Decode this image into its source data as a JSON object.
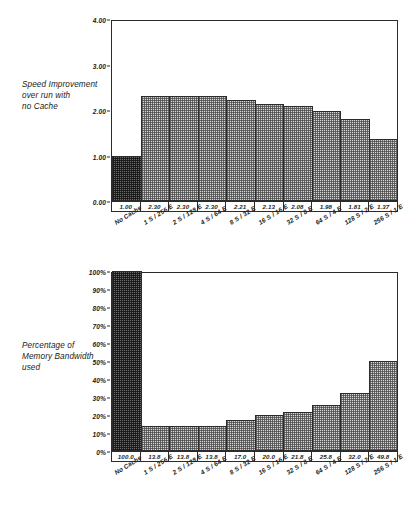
{
  "figure": {
    "panels": [
      {
        "id": "speed",
        "caption_lines": [
          "Speed Improvement",
          "over run with",
          "no Cache"
        ]
      },
      {
        "id": "bandwidth",
        "caption_lines": [
          "Percentage of",
          "Memory Bandwidth",
          "used"
        ]
      }
    ]
  },
  "chart_data": [
    {
      "type": "bar",
      "title": "Speed Improvement over run with no Cache",
      "xlabel": "",
      "ylabel": "Speed Improvement over run with no Cache",
      "ylim": [
        0,
        4
      ],
      "yticks": [
        "0.00",
        "1.00",
        "2.00",
        "3.00",
        "4.00"
      ],
      "ytick_values": [
        0,
        1,
        2,
        3,
        4
      ],
      "grid": false,
      "legend": "none",
      "categories": [
        "No Cache",
        "1 S / 256 E",
        "2 S / 128 E",
        "4 S / 64 E",
        "8 S / 32 E",
        "16 S / 16 E",
        "32 S / 8 E",
        "64 S / 4 E",
        "128 S / 2 E",
        "256 S / 1 E"
      ],
      "values": [
        1.0,
        2.3,
        2.3,
        2.3,
        2.21,
        2.13,
        2.08,
        1.98,
        1.81,
        1.37
      ],
      "value_labels": [
        "1.00",
        "2.30",
        "2.30",
        "2.30",
        "2.21",
        "2.13",
        "2.08",
        "1.98",
        "1.81",
        "1.37"
      ],
      "highlight_index": 0
    },
    {
      "type": "bar",
      "title": "Percentage of Memory Bandwidth used",
      "xlabel": "",
      "ylabel": "Percentage of Memory Bandwidth used",
      "ylim": [
        0,
        100
      ],
      "yticks": [
        "0%",
        "10%",
        "20%",
        "30%",
        "40%",
        "50%",
        "60%",
        "70%",
        "80%",
        "90%",
        "100%"
      ],
      "ytick_values": [
        0,
        10,
        20,
        30,
        40,
        50,
        60,
        70,
        80,
        90,
        100
      ],
      "grid": false,
      "legend": "none",
      "categories": [
        "No Cache",
        "1 S / 256 E",
        "2 S / 128 E",
        "4 S / 64 E",
        "8 S / 32 E",
        "16 S / 16 E",
        "32 S / 8 E",
        "64 S / 4 E",
        "128 S / 2 E",
        "256 S / 1 E"
      ],
      "values": [
        100.0,
        13.8,
        13.8,
        13.8,
        17.0,
        20.0,
        21.8,
        25.8,
        32.0,
        49.8
      ],
      "value_labels": [
        "100.0",
        "13.8",
        "13.8",
        "13.8",
        "17.0",
        "20.0",
        "21.8",
        "25.8",
        "32.0",
        "49.8"
      ],
      "highlight_index": 0
    }
  ]
}
